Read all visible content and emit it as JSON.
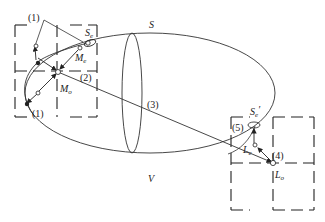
{
  "diagram": {
    "type": "geometric-schematic",
    "colors": {
      "stroke": "#333333",
      "background": "#ffffff",
      "text": "#222222"
    },
    "labels": {
      "surface": "S",
      "volume": "V",
      "step1_top": "(1)",
      "step1_bottom": "(1)",
      "step2": "(2)",
      "step3": "(3)",
      "step4": "(4)",
      "step5": "(5)",
      "Se_main": "S",
      "Se_sub": "e",
      "Se_prime_main": "S",
      "Se_prime_sub": "e",
      "Se_prime_mark": "′",
      "Me_main": "M",
      "Me_sub": "e",
      "Mo_main": "M",
      "Mo_sub": "o",
      "Le_main": "L",
      "Le_sub": "e",
      "Lo_main": "L",
      "Lo_sub": "o"
    }
  }
}
